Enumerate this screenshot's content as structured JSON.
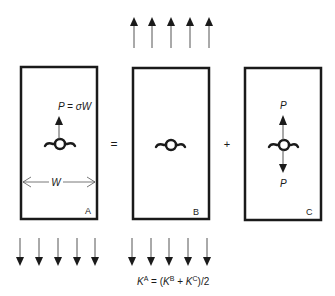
{
  "diagram": {
    "type": "superposition-of-loads",
    "operators": {
      "equals": "=",
      "plus": "+"
    },
    "panels": [
      {
        "id": "A",
        "label": "A",
        "load_label": "P = σW",
        "width_label": "W",
        "remote_stress": "top-and-bottom",
        "point_loads": [
          "up"
        ]
      },
      {
        "id": "B",
        "label": "B",
        "remote_stress": "top-and-bottom",
        "point_loads": []
      },
      {
        "id": "C",
        "label": "C",
        "load_label_top": "P",
        "load_label_bottom": "P",
        "point_loads": [
          "up",
          "down"
        ]
      }
    ],
    "formula": {
      "text": "K^A = (K^B + K^C)/2",
      "K": "K",
      "supA": "A",
      "mid1": " = (",
      "supB": "B",
      "mid2": " + ",
      "supC": "C",
      "tail": ")/2"
    },
    "colors": {
      "line": "#1a1a1a",
      "thin_line": "#555555",
      "background": "#ffffff"
    }
  }
}
